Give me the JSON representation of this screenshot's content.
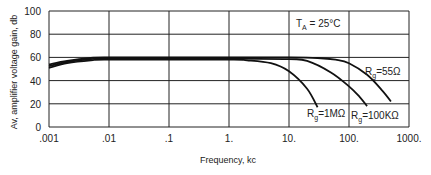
{
  "chart_data": {
    "type": "line",
    "title": "",
    "xlabel": "Frequency, kc",
    "ylabel": "Av, amplifier voltage gain, db",
    "xscale": "log",
    "xlim": [
      0.001,
      1000
    ],
    "ylim": [
      0,
      100
    ],
    "x_ticks": [
      ".001",
      ".01",
      ".1",
      "1.",
      "10.",
      "100.",
      "1000."
    ],
    "y_ticks": [
      "0",
      "20",
      "40",
      "60",
      "80",
      "100"
    ],
    "grid": true,
    "annotations": [
      {
        "text": "T_A = 25°C",
        "x": 30,
        "y": 83
      }
    ],
    "series": [
      {
        "name": "Rg = 55Ω",
        "x": [
          0.001,
          0.002,
          0.005,
          0.01,
          1,
          10,
          30,
          60,
          100,
          200,
          350,
          500
        ],
        "y": [
          54,
          57,
          59.5,
          60,
          60,
          60,
          59.5,
          58,
          55,
          45,
          32,
          22
        ]
      },
      {
        "name": "Rg = 100KΩ",
        "x": [
          0.001,
          0.002,
          0.005,
          0.01,
          1,
          10,
          20,
          50,
          100,
          150,
          200
        ],
        "y": [
          52.5,
          56,
          58.5,
          59,
          59,
          58.5,
          57,
          47,
          35,
          26,
          18
        ]
      },
      {
        "name": "Rg = 1MΩ",
        "x": [
          0.001,
          0.002,
          0.005,
          0.01,
          1,
          2,
          5,
          10,
          20,
          30
        ],
        "y": [
          51,
          55,
          57.5,
          58,
          58,
          57.5,
          55,
          48,
          33,
          17
        ]
      }
    ]
  },
  "labels": {
    "xlabel": "Frequency, kc",
    "ylabel": "Av, amplifier voltage gain, db",
    "ta_prefix": "T",
    "ta_sub": "A",
    "ta_value": " = 25°C",
    "rg_55": "=55Ω",
    "rg_100k": "=100KΩ",
    "rg_1m": "=1MΩ",
    "rg_prefix": "R",
    "rg_sub": "g"
  }
}
